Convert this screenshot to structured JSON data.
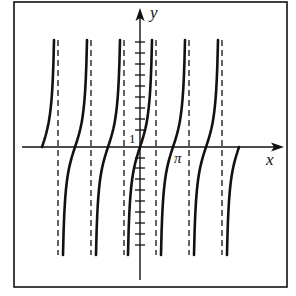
{
  "figure": {
    "frame": {
      "x": 14,
      "y": 2,
      "width": 273,
      "height": 285
    },
    "colors": {
      "ink": "#111111",
      "background": "#ffffff"
    },
    "axes": {
      "x_label": "x",
      "y_label": "y",
      "origin": {
        "x": 140,
        "y": 147
      },
      "x_axis": {
        "from": 22,
        "to": 282
      },
      "y_axis": {
        "from": 280,
        "to": 8
      }
    },
    "labels": {
      "one": "1",
      "pi": "π",
      "x": "x",
      "y": "y"
    },
    "asymptotes_x": [
      58,
      91,
      124,
      156,
      189,
      222
    ],
    "asymptote_y_range": [
      40,
      255
    ],
    "branch_zeros_x": [
      42,
      75,
      108,
      140,
      173,
      206,
      239
    ],
    "y_ticks": [
      42,
      53,
      64,
      75,
      86,
      97,
      108,
      119,
      130,
      158,
      168,
      179,
      190,
      201,
      212,
      223,
      234,
      245
    ]
  }
}
